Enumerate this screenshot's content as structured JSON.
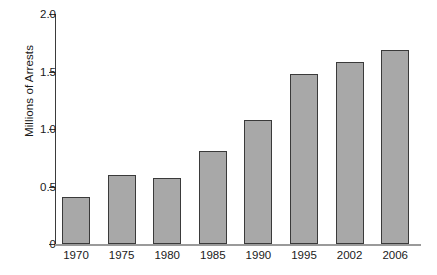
{
  "chart_data": {
    "type": "bar",
    "title": "",
    "subtitle": "",
    "xlabel": "",
    "ylabel": "Millions of Arrests",
    "categories": [
      "1970",
      "1975",
      "1980",
      "1985",
      "1990",
      "1995",
      "2002",
      "2006"
    ],
    "values": [
      0.41,
      0.6,
      0.57,
      0.81,
      1.08,
      1.48,
      1.58,
      1.69
    ],
    "ylim": [
      0,
      2.0
    ],
    "ytick_values": [
      0,
      0.5,
      1.0,
      1.5,
      2.0
    ],
    "ytick_labels": [
      "0",
      "0.5",
      "1.0",
      "1.5",
      "2.0"
    ],
    "grid": false,
    "legend": null,
    "legend_position": "none",
    "annotations": [],
    "series": [
      {
        "name": "Arrests",
        "values": [
          0.41,
          0.6,
          0.57,
          0.81,
          1.08,
          1.48,
          1.58,
          1.69
        ]
      }
    ],
    "colors": {
      "bar_fill": "#a8a8a8",
      "bar_stroke": "#3a3a3a",
      "axis": "#3b3b3b",
      "baseline": "#9a9a9a",
      "text": "#1a1a1a",
      "background": "#ffffff"
    }
  }
}
